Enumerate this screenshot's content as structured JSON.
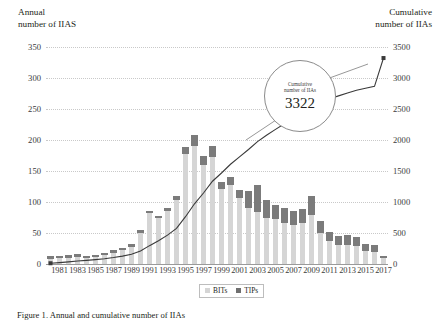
{
  "figure": {
    "left_axis_title": "Annual\nnumber of IIAS",
    "right_axis_title": "Cumulative\nnumber of IIAs",
    "caption": "Figure 1. Annual and cumulative number of IIAs"
  },
  "callout": {
    "label": "Cumulative\nnumber of IIAs",
    "value": "3322"
  },
  "legend": {
    "position": "bottom-center",
    "items": [
      {
        "label": "BITs",
        "color": "#d5d5d5"
      },
      {
        "label": "TIPs",
        "color": "#6f6f6f"
      }
    ]
  },
  "chart_data": {
    "type": "bar",
    "title": "",
    "subtitle": "",
    "xlabel": "",
    "ylabel": "Annual number of IIAS",
    "y2label": "Cumulative number of IIAs",
    "grid": true,
    "ylim": [
      0,
      350
    ],
    "y2lim": [
      0,
      3500
    ],
    "yticks": [
      0,
      50,
      100,
      150,
      200,
      250,
      300,
      350
    ],
    "y2ticks": [
      0,
      500,
      1000,
      1500,
      2000,
      2500,
      3000,
      3500
    ],
    "categories": [
      "1980",
      "1981",
      "1982",
      "1983",
      "1984",
      "1985",
      "1986",
      "1987",
      "1988",
      "1989",
      "1990",
      "1991",
      "1992",
      "1993",
      "1994",
      "1995",
      "1996",
      "1997",
      "1998",
      "1999",
      "2000",
      "2001",
      "2002",
      "2003",
      "2004",
      "2005",
      "2006",
      "2007",
      "2008",
      "2009",
      "2010",
      "2011",
      "2012",
      "2013",
      "2014",
      "2015",
      "2016",
      "2017"
    ],
    "xtick_labels": [
      "1981",
      "1983",
      "1985",
      "1987",
      "1989",
      "1991",
      "1993",
      "1995",
      "1997",
      "1999",
      "2001",
      "2003",
      "2005",
      "2007",
      "2009",
      "2011",
      "2013",
      "2015",
      "2017"
    ],
    "series": [
      {
        "name": "BITs",
        "color": "#d5d5d5",
        "values": [
          8,
          9,
          10,
          12,
          9,
          11,
          14,
          18,
          22,
          28,
          50,
          82,
          74,
          86,
          103,
          177,
          190,
          159,
          172,
          121,
          127,
          106,
          90,
          84,
          75,
          72,
          66,
          63,
          66,
          79,
          50,
          37,
          30,
          31,
          29,
          21,
          19,
          9
        ]
      },
      {
        "name": "TIPs",
        "color": "#6f6f6f",
        "values": [
          1,
          1,
          1,
          1,
          1,
          1,
          1,
          1,
          1,
          2,
          3,
          4,
          4,
          5,
          7,
          11,
          18,
          15,
          18,
          12,
          14,
          14,
          28,
          43,
          28,
          23,
          24,
          23,
          22,
          30,
          19,
          15,
          16,
          16,
          14,
          12,
          12,
          4
        ]
      }
    ],
    "cumulative": {
      "name": "Cumulative number of IIAs",
      "color": "#3a3a3a",
      "end_label": "3322",
      "values": [
        12,
        22,
        34,
        48,
        58,
        70,
        85,
        104,
        127,
        157,
        210,
        296,
        374,
        465,
        575,
        763,
        971,
        1145,
        1335,
        1468,
        1609,
        1729,
        1847,
        1974,
        2077,
        2172,
        2262,
        2348,
        2436,
        2545,
        2614,
        2666,
        2712,
        2759,
        2802,
        2835,
        2866,
        3322
      ]
    }
  }
}
